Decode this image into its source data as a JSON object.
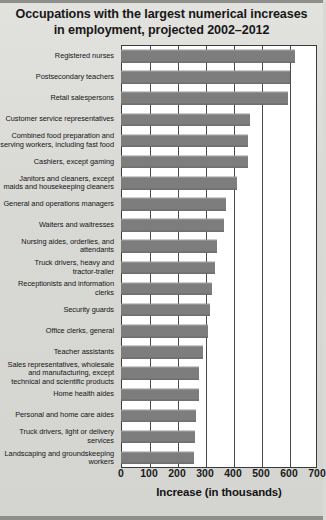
{
  "figure": {
    "title_lines": [
      "Occupations with the largest numerical increases",
      "in employment, projected 2002–2012"
    ],
    "colors": {
      "background": "#d9d9d6",
      "bar": "#7d7d7d",
      "plot_background": "#ffffff",
      "axis": "#3b3b3b",
      "text": "#151515"
    }
  },
  "chart_data": {
    "type": "bar",
    "orientation": "horizontal",
    "title": "Occupations with the largest numerical increases in employment, projected 2002–2012",
    "xlabel": "Increase (in thousands)",
    "ylabel": "",
    "xlim": [
      0,
      700
    ],
    "xticks": [
      0,
      100,
      200,
      300,
      400,
      500,
      600,
      700
    ],
    "xtick_labels": [
      "0",
      "100",
      "200",
      "300",
      "400",
      "500",
      "600",
      "700"
    ],
    "grid": true,
    "legend": "none",
    "units": "thousands of jobs",
    "categories": [
      "Registered nurses",
      "Postsecondary teachers",
      "Retail salespersons",
      "Customer service representatives",
      "Combined food preparation and serving workers, including fast food",
      "Cashiers, except gaming",
      "Janitors and cleaners, except maids and housekeeping cleaners",
      "General and operations managers",
      "Waiters and waitresses",
      "Nursing aides, orderlies, and attendants",
      "Truck drivers, heavy and tractor-trailer",
      "Receptionists and information clerks",
      "Security guards",
      "Office clerks, general",
      "Teacher assistants",
      "Sales representatives, wholesale and manufacturing, except technical and scientific products",
      "Home health aides",
      "Personal and home care aides",
      "Truck drivers, light or delivery services",
      "Landscaping and groundskeeping workers"
    ],
    "values": [
      623,
      603,
      596,
      460,
      454,
      454,
      414,
      376,
      367,
      343,
      337,
      325,
      317,
      310,
      294,
      279,
      279,
      268,
      263,
      261
    ]
  },
  "rows": [
    {
      "label_lines": [
        "Registered nurses"
      ],
      "value": 623
    },
    {
      "label_lines": [
        "Postsecondary teachers"
      ],
      "value": 603
    },
    {
      "label_lines": [
        "Retail salespersons"
      ],
      "value": 596
    },
    {
      "label_lines": [
        "Customer service representatives"
      ],
      "value": 460
    },
    {
      "label_lines": [
        "Combined food preparation and",
        "serving workers, including fast food"
      ],
      "value": 454
    },
    {
      "label_lines": [
        "Cashiers, except gaming"
      ],
      "value": 454
    },
    {
      "label_lines": [
        "Janitors and cleaners, except",
        "maids and housekeeping cleaners"
      ],
      "value": 414
    },
    {
      "label_lines": [
        "General and operations managers"
      ],
      "value": 376
    },
    {
      "label_lines": [
        "Waiters and waitresses"
      ],
      "value": 367
    },
    {
      "label_lines": [
        "Nursing aides, orderlies, and",
        "attendants"
      ],
      "value": 343
    },
    {
      "label_lines": [
        "Truck drivers, heavy and",
        "tractor-trailer"
      ],
      "value": 337
    },
    {
      "label_lines": [
        "Receptionists and information clerks"
      ],
      "value": 325
    },
    {
      "label_lines": [
        "Security guards"
      ],
      "value": 317
    },
    {
      "label_lines": [
        "Office clerks, general"
      ],
      "value": 310
    },
    {
      "label_lines": [
        "Teacher assistants"
      ],
      "value": 294
    },
    {
      "label_lines": [
        "Sales representatives, wholesale",
        "and manufacturing, except",
        "technical and scientific products"
      ],
      "value": 279
    },
    {
      "label_lines": [
        "Home health aides"
      ],
      "value": 279
    },
    {
      "label_lines": [
        "Personal and home care aides"
      ],
      "value": 268
    },
    {
      "label_lines": [
        "Truck drivers, light or delivery services"
      ],
      "value": 263
    },
    {
      "label_lines": [
        "Landscaping and groundskeeping",
        "workers"
      ],
      "value": 261
    }
  ],
  "axis": {
    "title": "Increase (in thousands)",
    "ticks": [
      "0",
      "100",
      "200",
      "300",
      "400",
      "500",
      "600",
      "700"
    ]
  }
}
